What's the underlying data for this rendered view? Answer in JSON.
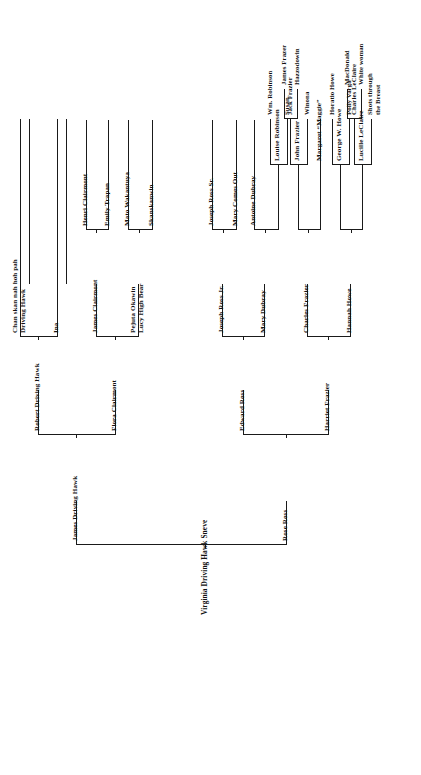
{
  "document": {
    "type": "genealogy-pedigree-chart",
    "orientation": "rotated-90-counterclockwise",
    "root_label": "Virginia Driving Hawk Sneve"
  },
  "people": {
    "root": "Virginia Driving Hawk Sneve",
    "g1_father": "James Driving Hawk",
    "g1_mother": "Rose Ross",
    "g2_a": "Robert Driving Hawk",
    "g2_b": "Flora Clairmont",
    "g2_c": "Edward Ross",
    "g2_d": "Harriet Frazier",
    "g3_a1": "Chan skan nah hoh pah\nDriving Hawk",
    "g3_a2": "Ina",
    "g3_b1": "James Clairmont",
    "g3_b2": "Pejuta Okawin\nLucy High Bear",
    "g3_c1": "Joseph Ross Jr.",
    "g3_c2": "Mary Dubray",
    "g3_d1": "Charles Frazier",
    "g3_d2": "Hannah Howe",
    "g4_b1a": "Henri Clairmont",
    "g4_b1b": "Emily Trapan",
    "g4_b2a": "Mato Wakantuya",
    "g4_b2b": "Skanskanwin",
    "g4_c1a": "Joseph Ross Sr.",
    "g4_c1b": "Mary Comes Out",
    "g4_c2a": "Antoine Dubray",
    "g4_c2b": "Louise Robinson",
    "g4_d1a": "John Frazier",
    "g4_d1b": "Margaret “Maggie”",
    "g4_d2a": "George W. Howe",
    "g4_d2b": "Lucille LeClaire",
    "g5_louise_a": "Wm. Robinson",
    "g5_louise_b": "Susan",
    "g5_john_a": "Jack Frazier",
    "g5_john_b": "Winona",
    "g5_george_a": "Horatio Howe",
    "g5_george_b": "Polly Varga",
    "g5_lucille_a": "Charles LeClaire",
    "g5_lucille_b": "Shots through\nthe Breast",
    "g6_jack_a": "James Frazer",
    "g6_jack_b": "Hazzodowin",
    "g6_charles_a": "MacDonald",
    "g6_charles_b": "White woman"
  },
  "style": {
    "ink_color": "#1a1a1a",
    "text_color": "#111111",
    "background": "#ffffff"
  }
}
